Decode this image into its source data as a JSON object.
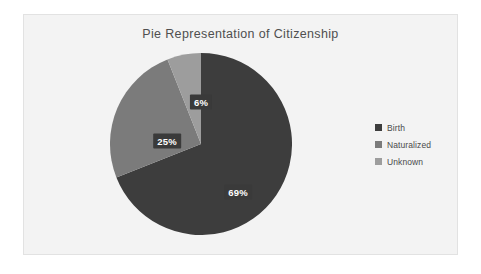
{
  "chart_data": {
    "type": "pie",
    "title": "Pie Representation of Citizenship",
    "categories": [
      "Birth",
      "Naturalized",
      "Unknown"
    ],
    "values": [
      69,
      25,
      6
    ],
    "value_labels": [
      "69%",
      "25%",
      "6%"
    ],
    "units": "percent",
    "total": 100,
    "start_angle_deg": 0,
    "direction": "clockwise",
    "legend_position": "right",
    "grid": false,
    "xlabel": "",
    "ylabel": "",
    "slice_colors": [
      "#3d3d3d",
      "#7b7b7b",
      "#9d9d9d"
    ],
    "label_text_color": "#ffffff",
    "label_background_color": "#3a3a3a",
    "slices": [
      {
        "name": "Birth",
        "value": 69,
        "label": "69%",
        "color": "#3d3d3d",
        "start_deg": 0,
        "end_deg": 248.4
      },
      {
        "name": "Naturalized",
        "value": 25,
        "label": "25%",
        "color": "#7b7b7b",
        "start_deg": 248.4,
        "end_deg": 338.4
      },
      {
        "name": "Unknown",
        "value": 6,
        "label": "6%",
        "color": "#9d9d9d",
        "start_deg": 338.4,
        "end_deg": 360
      }
    ]
  },
  "chart": {
    "title": "Pie Representation of Citizenship",
    "background_color": "#f3f3f3",
    "border_color": "#e2e2e2"
  },
  "labels": {
    "birth": "69%",
    "naturalized": "25%",
    "unknown": "6%"
  },
  "legend": {
    "items": [
      {
        "label": "Birth",
        "color": "#3d3d3d"
      },
      {
        "label": "Naturalized",
        "color": "#7b7b7b"
      },
      {
        "label": "Unknown",
        "color": "#9d9d9d"
      }
    ]
  }
}
